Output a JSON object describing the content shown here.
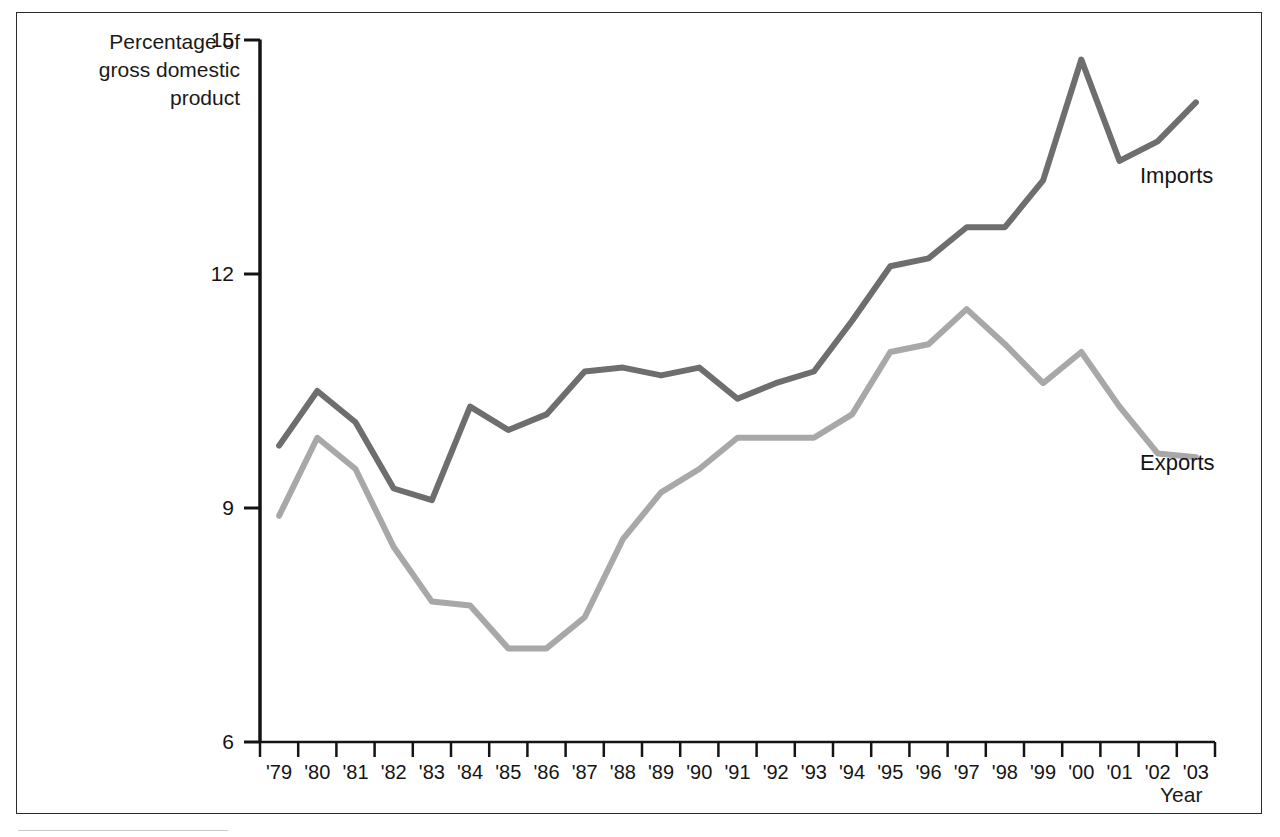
{
  "figure": {
    "y_axis_title": "Percentage of\ngross domestic\nproduct",
    "x_axis_title": "Year"
  },
  "legend": {
    "imports_label": "Imports",
    "exports_label": "Exports"
  },
  "colors": {
    "imports_line": "#6e6e6e",
    "exports_line": "#a8a8a8",
    "axis": "#141414",
    "frame": "#2b2b2b",
    "background": "#ffffff"
  },
  "chart_data": {
    "type": "line",
    "title": "",
    "subtitle": "",
    "xlabel": "Year",
    "ylabel": "Percentage of gross domestic product",
    "xlim": [
      "'79",
      "'03"
    ],
    "ylim": [
      6,
      15
    ],
    "yticks": [
      6,
      9,
      12,
      15
    ],
    "ytick_labels": [
      "6",
      "9",
      "12",
      "15"
    ],
    "grid": false,
    "legend_position": "inline-right-of-series",
    "categories": [
      "'79",
      "'80",
      "'81",
      "'82",
      "'83",
      "'84",
      "'85",
      "'86",
      "'87",
      "'88",
      "'89",
      "'90",
      "'91",
      "'92",
      "'93",
      "'94",
      "'95",
      "'96",
      "'97",
      "'98",
      "'99",
      "'00",
      "'01",
      "'02",
      "'03"
    ],
    "series": [
      {
        "name": "Imports",
        "color": "#6e6e6e",
        "values": [
          9.8,
          10.5,
          10.1,
          9.25,
          9.1,
          10.3,
          10.0,
          10.2,
          10.75,
          10.8,
          10.7,
          10.8,
          10.4,
          10.6,
          10.75,
          11.4,
          12.1,
          12.2,
          12.6,
          12.6,
          13.2,
          14.75,
          13.45,
          13.7,
          14.2
        ]
      },
      {
        "name": "Exports",
        "color": "#a8a8a8",
        "values": [
          8.9,
          9.9,
          9.5,
          8.5,
          7.8,
          7.75,
          7.2,
          7.2,
          7.6,
          8.6,
          9.2,
          9.5,
          9.9,
          9.9,
          9.9,
          10.2,
          11.0,
          11.1,
          11.55,
          11.1,
          10.6,
          11.0,
          10.3,
          9.7,
          9.65
        ]
      }
    ]
  }
}
